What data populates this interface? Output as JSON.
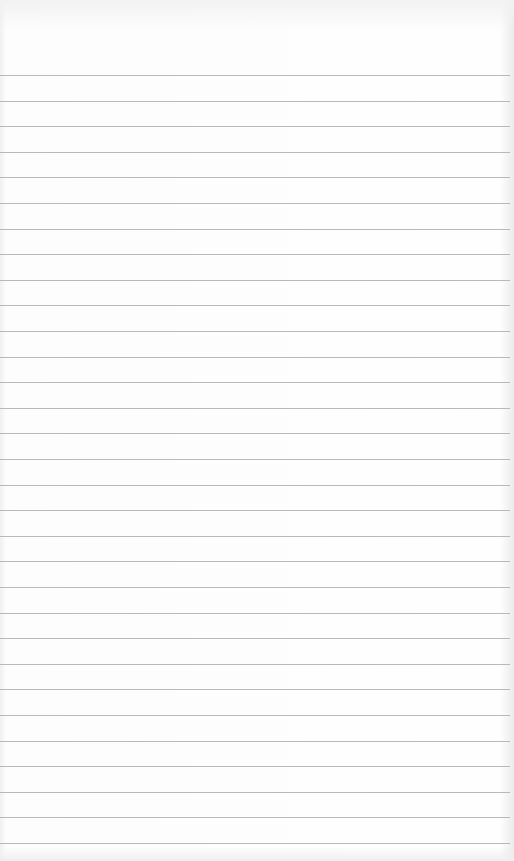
{
  "page": {
    "type": "blank-lined-paper",
    "line_count": 31,
    "first_line_y": 75,
    "line_spacing": 25.6,
    "line_color": "#b9b9b9",
    "paper_color": "#fdfdfd"
  }
}
